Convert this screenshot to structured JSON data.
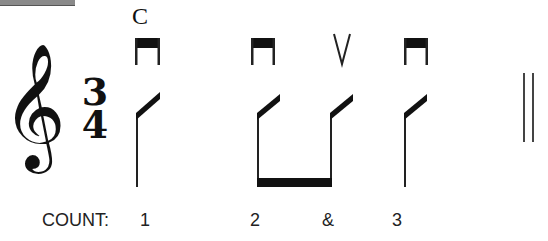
{
  "header_marking": "C",
  "clef": "treble-clef",
  "clef_glyph": "𝄞",
  "time_signature": {
    "top": "3",
    "bottom": "4"
  },
  "bowings": [
    "down-bow",
    "down-bow",
    "up-bow",
    "down-bow"
  ],
  "notes": [
    {
      "type": "quarter-slash",
      "bowing": "down-bow",
      "count": "1"
    },
    {
      "type": "eighth-slash",
      "bowing": "down-bow",
      "count": "2",
      "beamed_with_next": true
    },
    {
      "type": "eighth-slash",
      "bowing": "up-bow",
      "count": "&"
    },
    {
      "type": "quarter-slash",
      "bowing": "down-bow",
      "count": "3"
    }
  ],
  "count_label": "COUNT:",
  "counts": [
    "1",
    "2",
    "&",
    "3"
  ],
  "barline": "final-double-barline"
}
